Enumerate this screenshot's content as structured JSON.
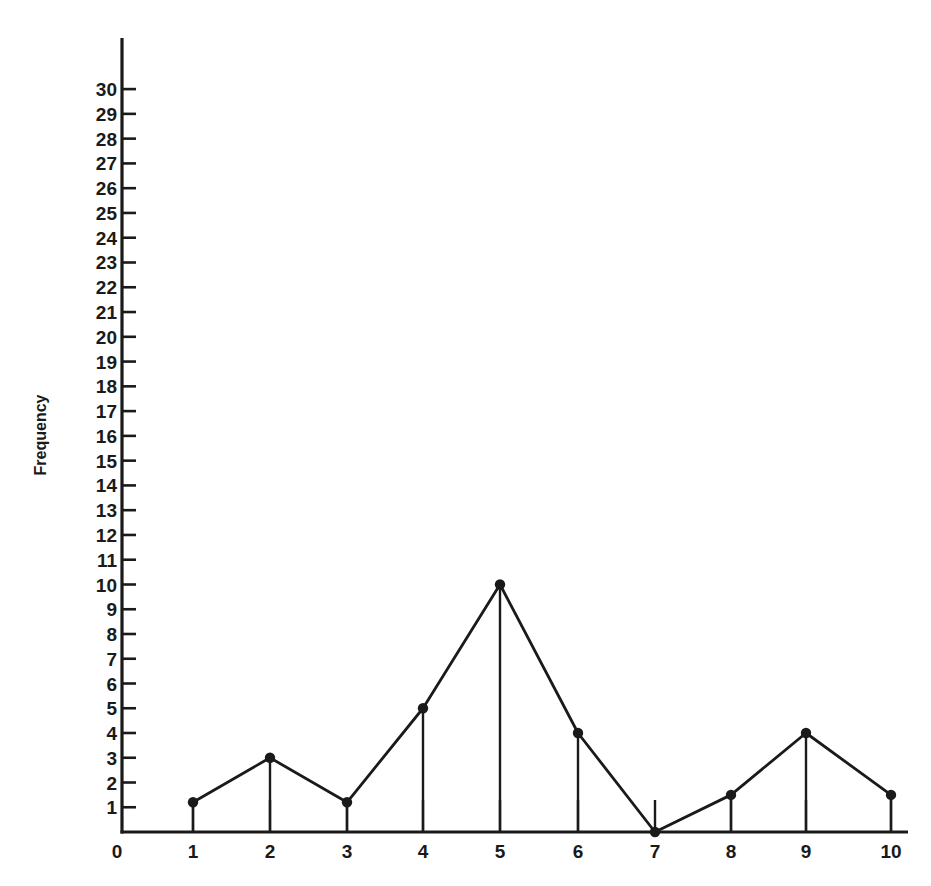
{
  "chart_data": {
    "type": "line",
    "title": "",
    "xlabel": "",
    "ylabel": "Frequency",
    "x": [
      1,
      2,
      3,
      4,
      5,
      6,
      7,
      8,
      9,
      10
    ],
    "series": [
      {
        "name": "Frequency",
        "values": [
          1.2,
          3,
          1.2,
          5,
          10,
          4,
          0,
          1.5,
          4,
          1.5
        ]
      }
    ],
    "x_tick_labels": [
      "0",
      "1",
      "2",
      "3",
      "4",
      "5",
      "6",
      "7",
      "8",
      "9",
      "10"
    ],
    "y_tick_labels": [
      "1",
      "2",
      "3",
      "4",
      "5",
      "6",
      "7",
      "8",
      "9",
      "10",
      "11",
      "12",
      "13",
      "14",
      "15",
      "16",
      "17",
      "18",
      "19",
      "20",
      "21",
      "22",
      "23",
      "24",
      "25",
      "26",
      "27",
      "28",
      "29",
      "30"
    ],
    "xlim": [
      0,
      10
    ],
    "ylim": [
      0,
      30
    ],
    "grid": false,
    "legend": null,
    "markers": "filled-circle",
    "drop_lines": true,
    "line_color": "#1a1a1a"
  }
}
